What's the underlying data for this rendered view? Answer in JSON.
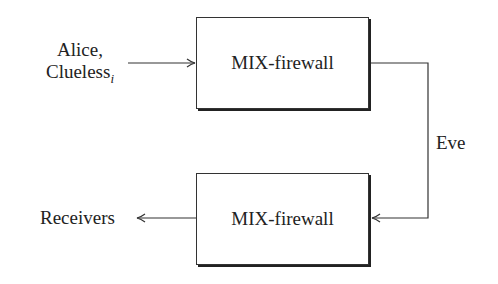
{
  "diagram": {
    "nodes": [
      {
        "id": "mix1",
        "label": "MIX-firewall"
      },
      {
        "id": "mix2",
        "label": "MIX-firewall"
      }
    ],
    "input_label": {
      "line1": "Alice,",
      "line2_main": "Clueless",
      "line2_sub": "i"
    },
    "channel_label": "Eve",
    "output_label": "Receivers",
    "edges": [
      {
        "from": "Alice, Clueless_i",
        "to": "mix1"
      },
      {
        "from": "mix1",
        "to": "mix2",
        "via": "Eve"
      },
      {
        "from": "mix2",
        "to": "Receivers"
      }
    ]
  }
}
